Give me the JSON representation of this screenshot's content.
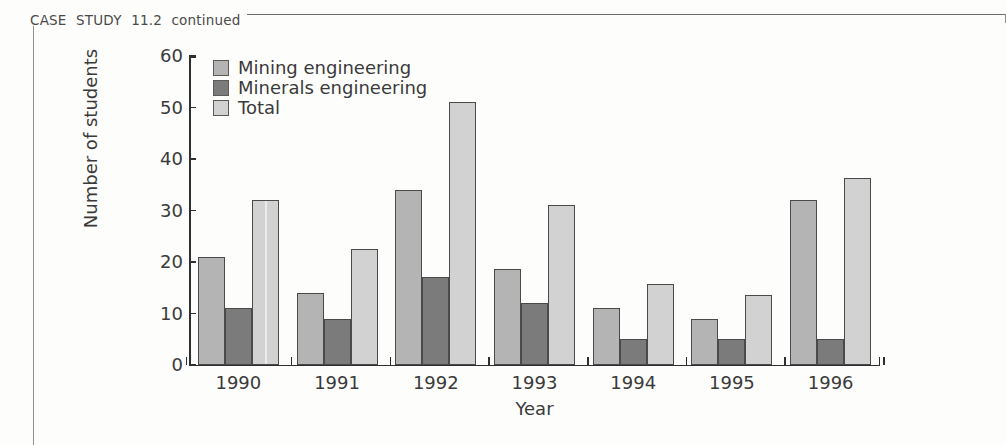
{
  "page": {
    "header_label": "CASE  STUDY  11.2  continued"
  },
  "chart_data": {
    "type": "bar",
    "title": "",
    "xlabel": "Year",
    "ylabel": "Number of students",
    "categories": [
      "1990",
      "1991",
      "1992",
      "1993",
      "1994",
      "1995",
      "1996"
    ],
    "series": [
      {
        "name": "Mining engineering",
        "color": "#b4b4b4",
        "values": [
          21,
          14,
          34,
          18.7,
          11,
          9,
          32
        ]
      },
      {
        "name": "Minerals engineering",
        "color": "#7b7b7b",
        "values": [
          11,
          9,
          17,
          12,
          5,
          5,
          5
        ]
      },
      {
        "name": "Total",
        "color": "#d2d2d2",
        "values": [
          32,
          22.5,
          51,
          31,
          15.7,
          13.5,
          36.3
        ]
      }
    ],
    "ylim": [
      0,
      60
    ],
    "yticks": [
      0,
      10,
      20,
      30,
      40,
      50,
      60
    ],
    "ytick_labels": [
      "0",
      "10",
      "20",
      "30",
      "40",
      "50",
      "60"
    ],
    "grid": false,
    "legend_position": "top-left"
  }
}
